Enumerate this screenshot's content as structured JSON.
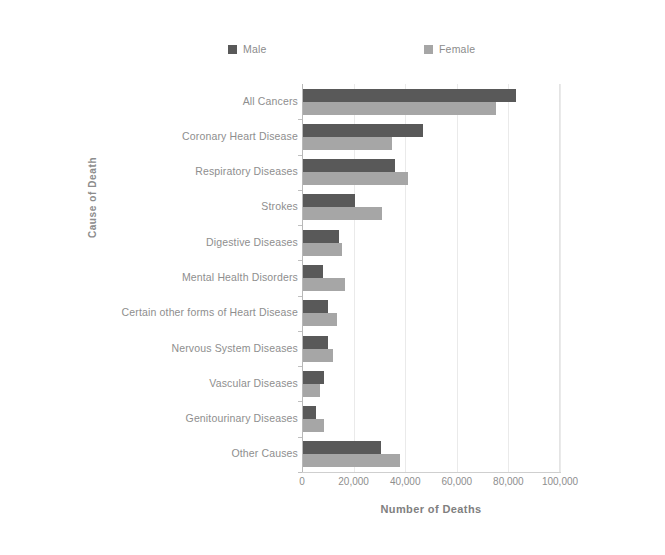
{
  "chart_data": {
    "type": "bar",
    "orientation": "horizontal",
    "title": "",
    "xlabel": "Number of Deaths",
    "ylabel": "Cause of Death",
    "xlim": [
      0,
      100000
    ],
    "xticks": [
      0,
      20000,
      40000,
      60000,
      80000,
      100000
    ],
    "xtick_labels": [
      "0",
      "20,000",
      "40,000",
      "60,000",
      "80,000",
      "100,000"
    ],
    "grid": true,
    "legend_position": "top",
    "categories": [
      "All Cancers",
      "Coronary Heart Disease",
      "Respiratory Diseases",
      "Strokes",
      "Digestive Diseases",
      "Mental Health Disorders",
      "Certain other forms of Heart Disease",
      "Nervous System Diseases",
      "Vascular Diseases",
      "Genitourinary Diseases",
      "Other Causes"
    ],
    "series": [
      {
        "name": "Male",
        "color": "#595959",
        "values": [
          83000,
          47000,
          36000,
          20500,
          14500,
          8000,
          10000,
          10000,
          8500,
          5500,
          30500
        ]
      },
      {
        "name": "Female",
        "color": "#a6a6a6",
        "values": [
          75000,
          35000,
          41000,
          31000,
          15500,
          16500,
          13500,
          12000,
          7000,
          8500,
          38000
        ]
      }
    ]
  },
  "legend": {
    "male_label": "Male",
    "female_label": "Female"
  },
  "axes": {
    "x_title": "Number of Deaths",
    "y_title": "Cause of Death"
  },
  "colors": {
    "male": "#595959",
    "female": "#a6a6a6",
    "gridline": "#eaeaea",
    "axis": "#b8b8b8",
    "text": "#8e8e8e",
    "background": "#ffffff"
  }
}
